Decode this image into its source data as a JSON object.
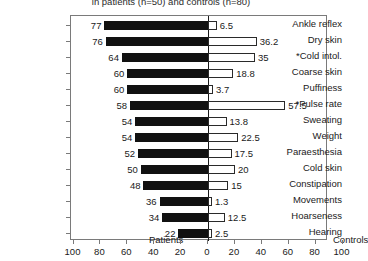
{
  "chart_data": {
    "type": "bar",
    "orientation": "horizontal-diverging",
    "title": "in patients (n=50) and controls (n=80)",
    "title_clipped": true,
    "xlabel": "",
    "ylabel": "",
    "grid": false,
    "xlim": [
      -100,
      100
    ],
    "axis_ticks": [
      "100",
      "80",
      "60",
      "40",
      "20",
      "0",
      "20",
      "40",
      "60",
      "80",
      "100"
    ],
    "axis_tick_values": [
      -100,
      -80,
      -60,
      -40,
      -20,
      0,
      20,
      40,
      60,
      80,
      100
    ],
    "categories": [
      "Ankle reflex",
      "Dry skin",
      "*Cold intol.",
      "Coarse skin",
      "Puffiness",
      "*Pulse rate",
      "Sweating",
      "Weight",
      "Paraesthesia",
      "Cold skin",
      "Constipation",
      "Movements",
      "Hoarseness",
      "Hearing"
    ],
    "series": [
      {
        "name": "Patients",
        "side": "left",
        "color": "#111111",
        "values": [
          77,
          76,
          64,
          60,
          60,
          58,
          54,
          54,
          52,
          50,
          48,
          36,
          34,
          22
        ],
        "labels": [
          "77",
          "76",
          "64",
          "60",
          "60",
          "58",
          "54",
          "54",
          "52",
          "50",
          "48",
          "36",
          "34",
          "22"
        ]
      },
      {
        "name": "Controls",
        "side": "right",
        "color": "#ffffff",
        "edge_color": "#2a2a2a",
        "values": [
          6.5,
          36.2,
          35,
          18.8,
          3.7,
          57.5,
          13.8,
          22.5,
          17.5,
          20,
          15,
          1.3,
          12.5,
          2.5
        ],
        "labels": [
          "6.5",
          "36.2",
          "35",
          "18.8",
          "3.7",
          "57.5",
          "13.8",
          "22.5",
          "17.5",
          "20",
          "15",
          "1.3",
          "12.5",
          "2.5"
        ]
      }
    ],
    "annotations": [
      {
        "text": "Patients",
        "side": "left"
      },
      {
        "text": "Controls",
        "side": "right"
      }
    ]
  }
}
